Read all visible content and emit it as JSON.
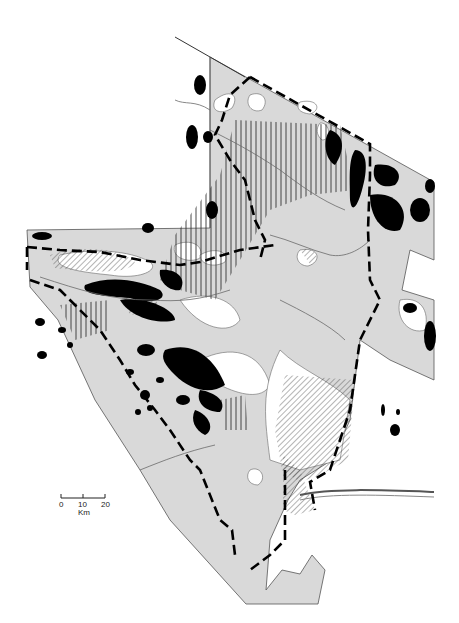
{
  "map": {
    "colors": {
      "land": "#d9d9d9",
      "background": "#ffffff",
      "ink": "#000000",
      "outline": "#555555",
      "river": "#6a6a6a",
      "hatch": "#444444"
    },
    "legend_visible": false
  },
  "scale_bar": {
    "ticks": [
      "0",
      "10",
      "20"
    ],
    "unit": "Km"
  }
}
